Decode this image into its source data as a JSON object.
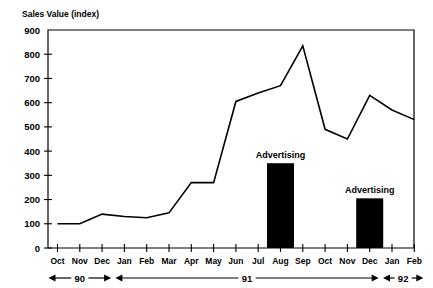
{
  "chart_data": {
    "type": "line",
    "title": "",
    "ylabel": "Sales Value (index)",
    "xlabel": "",
    "ylim": [
      0,
      900
    ],
    "yticks": [
      0,
      100,
      200,
      300,
      400,
      500,
      600,
      700,
      800,
      900
    ],
    "ytick_labels": [
      "0",
      "100",
      "200",
      "300",
      "400",
      "500",
      "600",
      "700",
      "800",
      "900"
    ],
    "grid": false,
    "legend": "none",
    "categories": [
      "Oct",
      "Nov",
      "Dec",
      "Jan",
      "Feb",
      "Mar",
      "Apr",
      "May",
      "Jun",
      "Jul",
      "Aug",
      "Sep",
      "Oct",
      "Nov",
      "Dec",
      "Jan",
      "Feb"
    ],
    "values": [
      100,
      100,
      140,
      130,
      125,
      145,
      270,
      270,
      605,
      640,
      670,
      835,
      490,
      450,
      630,
      570,
      530
    ],
    "series": [
      {
        "name": "Sales Value (index)",
        "values": [
          100,
          100,
          140,
          130,
          125,
          145,
          270,
          270,
          605,
          640,
          670,
          835,
          490,
          450,
          630,
          570,
          530
        ]
      }
    ],
    "overlay_bars": [
      {
        "label": "Advertising",
        "category": "Aug",
        "category_index": 10,
        "value": 350
      },
      {
        "label": "Advertising",
        "category": "Dec",
        "category_index": 14,
        "value": 205
      }
    ],
    "year_brackets": [
      {
        "label": "90",
        "start_index": 0,
        "end_index": 2
      },
      {
        "label": "91",
        "start_index": 3,
        "end_index": 14
      },
      {
        "label": "92",
        "start_index": 15,
        "end_index": 16
      }
    ],
    "colors": {
      "line": "#000000",
      "bar": "#000000",
      "axis": "#000000",
      "background": "#ffffff"
    }
  }
}
